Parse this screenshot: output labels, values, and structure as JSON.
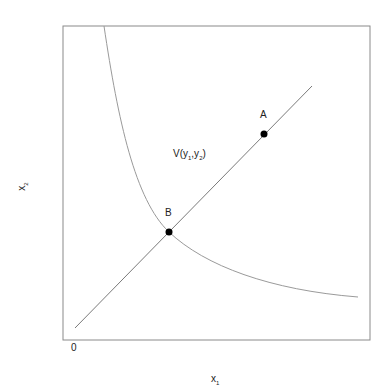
{
  "diagram": {
    "axes": {
      "x_label": "x",
      "x_sub": "1",
      "y_label": "x",
      "y_sub": "2",
      "origin_label": "0"
    },
    "curve_label": {
      "prefix": "V(y",
      "sub1": "1",
      "mid": ",y",
      "sub2": "2",
      "suffix": ")"
    },
    "points": [
      {
        "label": "A",
        "x": 264,
        "y": 134
      },
      {
        "label": "B",
        "x": 169,
        "y": 232
      }
    ],
    "colors": {
      "frame": "#8a8a8a",
      "line": "#7a7a7a",
      "curve": "#9a9a9a",
      "point": "#000000"
    }
  }
}
